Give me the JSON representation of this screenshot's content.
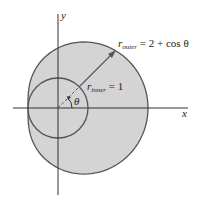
{
  "figure": {
    "type": "polar-region-diagram",
    "axes": {
      "x_label": "x",
      "y_label": "y"
    },
    "curves": [
      {
        "name": "outer",
        "label_r": "r",
        "label_sub": "outer",
        "label_rest": " = 2 + cos θ",
        "equation": "r = 2 + cos θ"
      },
      {
        "name": "inner",
        "label_r": "r",
        "label_sub": "inner",
        "label_rest": " = 1",
        "equation": "r = 1"
      }
    ],
    "angle_label": "θ",
    "colors": {
      "region_fill": "#d4d4d4",
      "inner_fill": "#d4d4d4",
      "stroke": "#555555",
      "axis": "#333333",
      "background": "#ffffff"
    }
  }
}
